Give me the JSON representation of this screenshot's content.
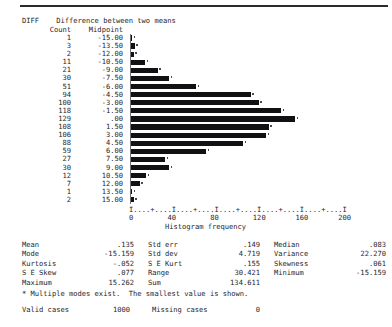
{
  "report": {
    "variable_name": "DIFF",
    "variable_label": "Difference between two means",
    "count_header": "Count",
    "midpoint_header": "Midpoint"
  },
  "chart_data": {
    "type": "bar",
    "orientation": "horizontal",
    "title": "Difference between two means",
    "xlabel": "Histogram frequency",
    "ylabel": "Midpoint",
    "xlim": [
      0,
      200
    ],
    "xticks": [
      0,
      40,
      80,
      120,
      160,
      200
    ],
    "xtick_labels": [
      "0",
      "40",
      "80",
      "120",
      "160",
      "200"
    ],
    "grid": false,
    "legend": "none",
    "axis_ruler": "I....+....I....+....I....+....I....+....I....+....I",
    "categories": [
      -15.0,
      -13.5,
      -12.0,
      -10.5,
      -9.0,
      -7.5,
      -6.0,
      -4.5,
      -3.0,
      -1.5,
      0.0,
      1.5,
      3.0,
      4.5,
      6.0,
      7.5,
      9.0,
      10.5,
      12.0,
      13.5,
      15.0
    ],
    "category_labels": [
      "-15.00",
      "-13.50",
      "-12.00",
      "-10.50",
      "-9.00",
      "-7.50",
      "-6.00",
      "-4.50",
      "-3.00",
      "-1.50",
      ".00",
      "1.50",
      "3.00",
      "4.50",
      "6.00",
      "7.50",
      "9.00",
      "10.50",
      "12.00",
      "13.50",
      "15.00"
    ],
    "values": [
      1,
      3,
      2,
      11,
      21,
      30,
      51,
      94,
      100,
      118,
      129,
      108,
      106,
      88,
      59,
      27,
      30,
      12,
      7,
      1,
      2
    ],
    "value_labels": [
      "1",
      "3",
      "2",
      "11",
      "21",
      "30",
      "51",
      "94",
      "100",
      "118",
      "129",
      "108",
      "106",
      "88",
      "59",
      "27",
      "30",
      "12",
      "7",
      "1",
      "2"
    ]
  },
  "statistics": {
    "rows": [
      [
        {
          "label": "Mean",
          "value": ".135"
        },
        {
          "label": "Std err",
          "value": ".149"
        },
        {
          "label": "Median",
          "value": ".083"
        }
      ],
      [
        {
          "label": "Mode",
          "value": "-15.159"
        },
        {
          "label": "Std dev",
          "value": "4.719"
        },
        {
          "label": "Variance",
          "value": "22.270"
        }
      ],
      [
        {
          "label": "Kurtosis",
          "value": "-.052"
        },
        {
          "label": "S E Kurt",
          "value": ".155"
        },
        {
          "label": "Skewness",
          "value": ".061"
        }
      ],
      [
        {
          "label": "S E Skew",
          "value": ".077"
        },
        {
          "label": "Range",
          "value": "30.421"
        },
        {
          "label": "Minimum",
          "value": "-15.159"
        }
      ],
      [
        {
          "label": "Maximum",
          "value": "15.262"
        },
        {
          "label": "Sum",
          "value": "134.611"
        },
        {
          "label": "",
          "value": ""
        }
      ]
    ]
  },
  "footer": {
    "note": "* Multiple modes exist.  The smallest value is shown.",
    "valid_cases_label": "Valid cases",
    "valid_cases_value": "1000",
    "missing_cases_label": "Missing cases",
    "missing_cases_value": "0"
  }
}
